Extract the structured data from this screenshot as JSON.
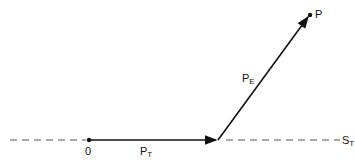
{
  "labels": {
    "origin": "0",
    "point": "P",
    "pt": {
      "main": "P",
      "sub": "T"
    },
    "pe": {
      "main": "P",
      "sub": "E"
    },
    "st": {
      "main": "S",
      "sub": "T"
    }
  },
  "colors": {
    "stroke": "#111111",
    "dash": "#555555"
  }
}
